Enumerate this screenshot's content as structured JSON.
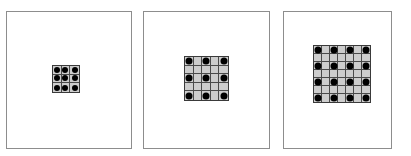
{
  "figure": {
    "title": "",
    "background_color": "#ffffff",
    "panel_border_color": "#8d8d8d",
    "grid_line_color": "#4a4a4a",
    "grid_fill_color": "#cdcdcd",
    "dot_color": "#000000",
    "panel_count": 3
  },
  "panels": [
    {
      "name": "panel-1",
      "label": "",
      "x": 6,
      "y": 11,
      "width": 126,
      "height": 138,
      "grid": {
        "cols": 3,
        "rows": 3,
        "x": 52,
        "y": 65,
        "width": 28,
        "height": 28,
        "dot_diameter": 6,
        "dot_step": 1,
        "dot_rows": 3,
        "dot_cols": 3
      }
    },
    {
      "name": "panel-2",
      "label": "",
      "x": 143,
      "y": 11,
      "width": 127,
      "height": 138,
      "grid": {
        "cols": 5,
        "rows": 5,
        "x": 184,
        "y": 56,
        "width": 45,
        "height": 45,
        "dot_diameter": 7,
        "dot_step": 2,
        "dot_rows": 3,
        "dot_cols": 3
      }
    },
    {
      "name": "panel-3",
      "label": "",
      "x": 283,
      "y": 11,
      "width": 109,
      "height": 138,
      "grid": {
        "cols": 7,
        "rows": 7,
        "x": 313,
        "y": 45,
        "width": 58,
        "height": 58,
        "dot_diameter": 7,
        "dot_step": 2,
        "dot_rows": 3,
        "dot_cols": 3
      }
    }
  ]
}
